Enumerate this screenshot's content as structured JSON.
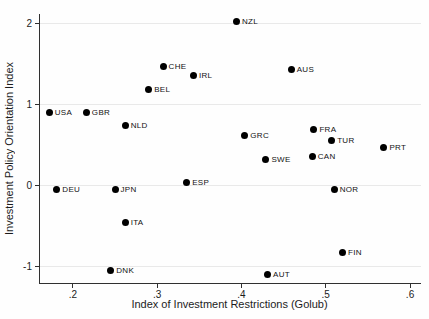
{
  "chart_data": {
    "type": "scatter",
    "title": "",
    "xlabel": "Index of Investment Restrictions (Golub)",
    "ylabel": "Investment Policy Orientation Index",
    "xlim": [
      0.161,
      0.613
    ],
    "ylim": [
      -1.2,
      2.12
    ],
    "grid": "horizontal",
    "legend": "none",
    "marker_color": "#000000",
    "grid_color": "#e9e9e9",
    "axis_color": "#303030",
    "x_ticks": [
      {
        "value": 0.2,
        "label": ".2"
      },
      {
        "value": 0.3,
        "label": ".3"
      },
      {
        "value": 0.4,
        "label": ".4"
      },
      {
        "value": 0.5,
        "label": ".5"
      },
      {
        "value": 0.6,
        "label": ".6"
      }
    ],
    "y_ticks": [
      {
        "value": 2,
        "label": "2"
      },
      {
        "value": 1,
        "label": "1"
      },
      {
        "value": 0,
        "label": "0"
      },
      {
        "value": -1,
        "label": "-1"
      }
    ],
    "points": [
      {
        "label": "USA",
        "x": 0.172,
        "y": 0.9
      },
      {
        "label": "DEU",
        "x": 0.181,
        "y": -0.04
      },
      {
        "label": "GBR",
        "x": 0.216,
        "y": 0.9
      },
      {
        "label": "DNK",
        "x": 0.245,
        "y": -1.05
      },
      {
        "label": "JPN",
        "x": 0.25,
        "y": -0.04
      },
      {
        "label": "NLD",
        "x": 0.262,
        "y": 0.74
      },
      {
        "label": "ITA",
        "x": 0.262,
        "y": -0.45
      },
      {
        "label": "BEL",
        "x": 0.29,
        "y": 1.19
      },
      {
        "label": "CHE",
        "x": 0.307,
        "y": 1.47
      },
      {
        "label": "ESP",
        "x": 0.335,
        "y": 0.04
      },
      {
        "label": "IRL",
        "x": 0.343,
        "y": 1.36
      },
      {
        "label": "NZL",
        "x": 0.394,
        "y": 2.03
      },
      {
        "label": "GRC",
        "x": 0.404,
        "y": 0.62
      },
      {
        "label": "SWE",
        "x": 0.429,
        "y": 0.32
      },
      {
        "label": "AUT",
        "x": 0.431,
        "y": -1.1
      },
      {
        "label": "AUS",
        "x": 0.459,
        "y": 1.44
      },
      {
        "label": "CAN",
        "x": 0.484,
        "y": 0.36
      },
      {
        "label": "FRA",
        "x": 0.486,
        "y": 0.69
      },
      {
        "label": "TUR",
        "x": 0.507,
        "y": 0.56
      },
      {
        "label": "NOR",
        "x": 0.51,
        "y": -0.05
      },
      {
        "label": "FIN",
        "x": 0.52,
        "y": -0.82
      },
      {
        "label": "PRT",
        "x": 0.569,
        "y": 0.47
      }
    ]
  }
}
